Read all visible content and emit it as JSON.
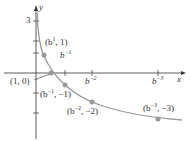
{
  "axes": {
    "x_label": "x",
    "y_label": "y",
    "y_tick": "3"
  },
  "points": [
    {
      "base": "(b",
      "exp": "1",
      "rest": ", 1)"
    },
    {
      "text": "(1, 0)"
    },
    {
      "base": "(b",
      "exp": "−1",
      "rest": ", −1)"
    },
    {
      "base": "(b",
      "exp": "−2",
      "rest": ", −2)"
    },
    {
      "base": "(b",
      "exp": "−3",
      "rest": ", −3)"
    }
  ],
  "x_ticks": [
    {
      "base": "b",
      "exp": "−1"
    },
    {
      "base": "b",
      "exp": "−2"
    },
    {
      "base": "b",
      "exp": "−3"
    }
  ],
  "colors": {
    "curve": "#999999",
    "point": "#999999",
    "axis": "#333333"
  }
}
